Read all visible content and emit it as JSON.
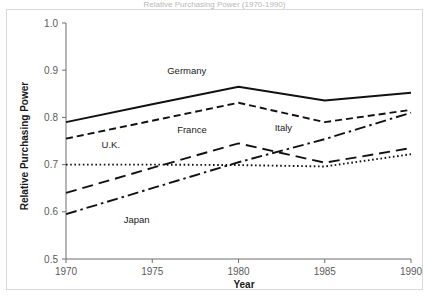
{
  "figure": {
    "title_fragment": "Relative Purchasing Power (1970-1990)",
    "frame": true
  },
  "axis": {
    "x_title": "Year",
    "y_title": "Relative Purchasing Power",
    "x_ticks": [
      "1970",
      "1975",
      "1980",
      "1985",
      "1990"
    ],
    "y_ticks": [
      "0.5",
      "0.6",
      "0.7",
      "0.8",
      "0.9",
      "1.0"
    ]
  },
  "series_labels": {
    "germany": "Germany",
    "france": "France",
    "uk": "U.K.",
    "italy": "Italy",
    "japan": "Japan"
  },
  "chart_data": {
    "type": "line",
    "title": "Relative Purchasing Power (1970-1990)",
    "xlabel": "Year",
    "ylabel": "Relative Purchasing Power",
    "x": [
      1970,
      1975,
      1980,
      1985,
      1990
    ],
    "xlim": [
      1970,
      1990
    ],
    "ylim": [
      0.5,
      1.0
    ],
    "xticks": [
      1970,
      1975,
      1980,
      1985,
      1990
    ],
    "yticks": [
      0.5,
      0.6,
      0.7,
      0.8,
      0.9,
      1.0
    ],
    "grid": false,
    "legend": "inline-labels",
    "series": [
      {
        "name": "Germany",
        "style": "solid",
        "values": [
          0.79,
          0.828,
          0.865,
          0.836,
          0.852
        ],
        "label_x": 1977.0,
        "label_y": 0.893
      },
      {
        "name": "France",
        "style": "dashed",
        "values": [
          0.755,
          0.793,
          0.831,
          0.79,
          0.816
        ],
        "label_x": 1977.3,
        "label_y": 0.766
      },
      {
        "name": "U.K.",
        "style": "dotted",
        "values": [
          0.7,
          0.7,
          0.699,
          0.696,
          0.722
        ],
        "label_x": 1972.6,
        "label_y": 0.736
      },
      {
        "name": "Italy",
        "style": "long-dashed",
        "values": [
          0.64,
          0.693,
          0.745,
          0.704,
          0.735
        ],
        "label_x": 1982.6,
        "label_y": 0.772
      },
      {
        "name": "Japan",
        "style": "dash-dot",
        "values": [
          0.595,
          0.65,
          0.705,
          0.754,
          0.81
        ],
        "label_x": 1974.1,
        "label_y": 0.576
      }
    ]
  }
}
